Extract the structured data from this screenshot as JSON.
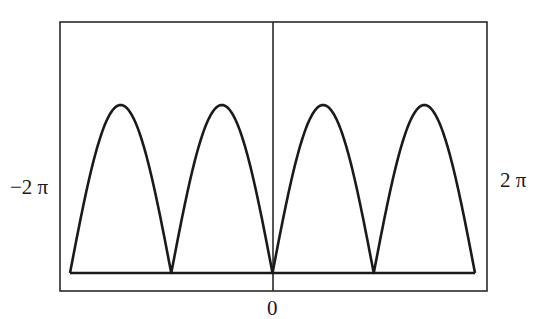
{
  "chart_data": {
    "type": "line",
    "title": "",
    "xlabel": "",
    "ylabel": "",
    "function": "|sin(x)|",
    "xlim": [
      -6.2832,
      6.2832
    ],
    "ylim": [
      0,
      1
    ],
    "x_tick_labels": {
      "left": "−2 π",
      "center": "0",
      "right": "2 π"
    },
    "grid": false,
    "legend": null,
    "series": [
      {
        "name": "|sin(x)|",
        "x": [
          -6.2832,
          -5.4978,
          -4.7124,
          -3.927,
          -3.1416,
          -2.3562,
          -1.5708,
          -0.7854,
          0,
          0.7854,
          1.5708,
          2.3562,
          3.1416,
          3.927,
          4.7124,
          5.4978,
          6.2832
        ],
        "values": [
          0,
          0.707,
          1,
          0.707,
          0,
          0.707,
          1,
          0.707,
          0,
          0.707,
          1,
          0.707,
          0,
          0.707,
          1,
          0.707,
          0
        ]
      }
    ],
    "zeros_at": [
      "-2π",
      "-π",
      "0",
      "π",
      "2π"
    ],
    "arch_count": 4
  },
  "labels": {
    "left": "−2 π",
    "right": "2 π",
    "zero": "0"
  },
  "style": {
    "line_color": "#1a1a1a",
    "frame_color": "#2a2a2a",
    "background": "#ffffff"
  }
}
